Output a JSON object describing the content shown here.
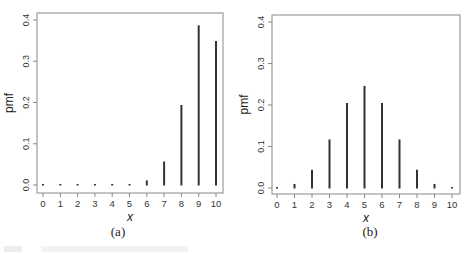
{
  "chart_data": [
    {
      "type": "bar",
      "subtype": "stem/pmf (vertical lines)",
      "panel_label": "(a)",
      "title": "",
      "xlabel": "x",
      "ylabel": "pmf",
      "categories": [
        "0",
        "1",
        "2",
        "3",
        "4",
        "5",
        "6",
        "7",
        "8",
        "9",
        "10"
      ],
      "values": [
        0.0,
        0.0,
        0.0,
        0.0,
        0.0,
        0.0015,
        0.011,
        0.057,
        0.194,
        0.387,
        0.349
      ],
      "xticks": [
        "0",
        "1",
        "2",
        "3",
        "4",
        "5",
        "6",
        "7",
        "8",
        "9",
        "10"
      ],
      "yticks": [
        "0.0",
        "0.1",
        "0.2",
        "0.3",
        "0.4"
      ],
      "ylim": [
        0,
        0.4
      ],
      "grid": false,
      "legend": null
    },
    {
      "type": "bar",
      "subtype": "stem/pmf (vertical lines)",
      "panel_label": "(b)",
      "title": "",
      "xlabel": "x",
      "ylabel": "pmf",
      "categories": [
        "0",
        "1",
        "2",
        "3",
        "4",
        "5",
        "6",
        "7",
        "8",
        "9",
        "10"
      ],
      "values": [
        0.001,
        0.0098,
        0.044,
        0.117,
        0.205,
        0.246,
        0.205,
        0.117,
        0.044,
        0.0098,
        0.001
      ],
      "xticks": [
        "0",
        "1",
        "2",
        "3",
        "4",
        "5",
        "6",
        "7",
        "8",
        "9",
        "10"
      ],
      "yticks": [
        "0.0",
        "0.1",
        "0.2",
        "0.3",
        "0.4"
      ],
      "ylim": [
        0,
        0.4
      ],
      "grid": false,
      "legend": null
    }
  ],
  "panels": [
    {
      "label": "(a)",
      "xlabel": "x",
      "ylabel": "pmf"
    },
    {
      "label": "(b)",
      "xlabel": "x",
      "ylabel": "pmf"
    }
  ],
  "style": {
    "line_color": "#333333",
    "frame_color": "#888888",
    "text_color": "#333333"
  }
}
